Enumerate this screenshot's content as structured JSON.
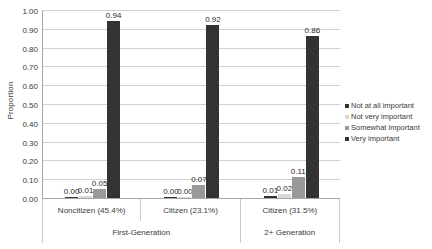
{
  "chart_data": {
    "type": "bar",
    "title": "",
    "xlabel": "",
    "ylabel": "Proportion",
    "ylim": [
      0,
      1.0
    ],
    "ytick_labels": [
      "1.00",
      "0.90",
      "0.80",
      "0.70",
      "0.60",
      "0.50",
      "0.40",
      "0.30",
      "0.20",
      "0.10",
      "0.00"
    ],
    "ytick_values": [
      1.0,
      0.9,
      0.8,
      0.7,
      0.6,
      0.5,
      0.4,
      0.3,
      0.2,
      0.1,
      0.0
    ],
    "grid": true,
    "legend_position": "right",
    "categories": [
      "Noncitizen (45.4%)",
      "Citizen (23.1%)",
      "Citizen (31.5%)"
    ],
    "group_labels": [
      "First-Generation",
      "2+ Generation"
    ],
    "group_spans": [
      2,
      1
    ],
    "series": [
      {
        "name": "Not at all important",
        "color": "#333333",
        "values": [
          0.0,
          0.0,
          0.01
        ],
        "labels": [
          "0.00",
          "0.00",
          "0.01"
        ]
      },
      {
        "name": "Not very important",
        "color": "#d9d9d9",
        "values": [
          0.01,
          0.0,
          0.02
        ],
        "labels": [
          "0.01",
          "0.00",
          "0.02"
        ]
      },
      {
        "name": "Somewhat important",
        "color": "#999999",
        "values": [
          0.05,
          0.07,
          0.11
        ],
        "labels": [
          "0.05",
          "0.07",
          "0.11"
        ]
      },
      {
        "name": "Very important",
        "color": "#333333",
        "values": [
          0.94,
          0.92,
          0.86
        ],
        "labels": [
          "0.94",
          "0.92",
          "0.86"
        ]
      }
    ]
  }
}
